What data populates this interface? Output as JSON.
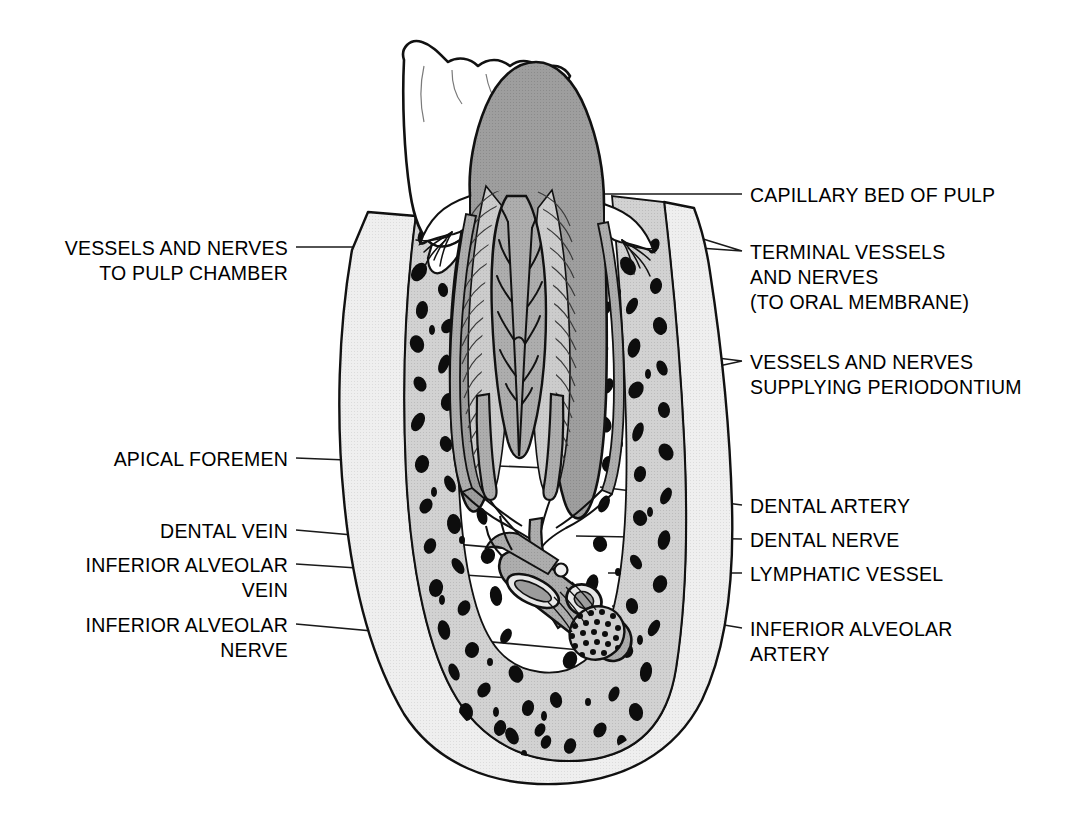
{
  "figure": {
    "background_color": "#ffffff",
    "line_color": "#000000",
    "colors": {
      "enamel": "#ffffff",
      "dentin": "#9b9b9b",
      "dentin_tubules": "#c9c9c9",
      "pulp": "#bdbdbd",
      "cortical_bone": "#ececec",
      "cancellous_bone": "#cfcfcf",
      "trabeculae": "#000000",
      "vessel_fill": "#a8a8a8",
      "gingiva": "#ffffff"
    }
  },
  "labels_left": [
    {
      "name": "vessels-and-nerves-to-pulp-chamber",
      "lines": [
        "VESSELS AND NERVES",
        "TO PULP CHAMBER"
      ],
      "text": "VESSELS AND NERVES\nTO PULP CHAMBER",
      "x": 288,
      "y": 236,
      "leader_from": [
        296,
        247
      ],
      "leader_to": [
        455,
        247
      ]
    },
    {
      "name": "apical-foramen",
      "lines": [
        "APICAL FOREMEN"
      ],
      "text": "APICAL FOREMEN",
      "x": 288,
      "y": 447,
      "leader_from": [
        296,
        458
      ],
      "leader_to": [
        548,
        468
      ]
    },
    {
      "name": "dental-vein",
      "lines": [
        "DENTAL VEIN"
      ],
      "text": "DENTAL VEIN",
      "x": 288,
      "y": 519,
      "leader_from": [
        296,
        530
      ],
      "leader_to": [
        545,
        552
      ]
    },
    {
      "name": "inferior-alveolar-vein",
      "lines": [
        "INFERIOR ALVEOLAR",
        "VEIN"
      ],
      "text": "INFERIOR ALVEOLAR\nVEIN",
      "x": 288,
      "y": 553,
      "leader_from": [
        296,
        564
      ],
      "leader_to": [
        555,
        580
      ]
    },
    {
      "name": "inferior-alveolar-nerve",
      "lines": [
        "INFERIOR ALVEOLAR",
        "NERVE"
      ],
      "text": "INFERIOR ALVEOLAR\nNERVE",
      "x": 288,
      "y": 613,
      "leader_from": [
        296,
        624
      ],
      "leader_to": [
        578,
        648
      ]
    }
  ],
  "labels_right": [
    {
      "name": "capillary-bed-of-pulp",
      "lines": [
        "CAPILLARY BED OF PULP"
      ],
      "text": "CAPILLARY BED OF PULP",
      "x": 750,
      "y": 183,
      "leader_from": [
        742,
        194
      ],
      "leader_to": [
        540,
        194
      ]
    },
    {
      "name": "terminal-vessels-and-nerves",
      "lines": [
        "TERMINAL VESSELS",
        "AND NERVES",
        "(TO ORAL MEMBRANE)"
      ],
      "text": "TERMINAL VESSELS\nAND NERVES\n(TO ORAL MEMBRANE)",
      "x": 750,
      "y": 240,
      "leader_from": [
        742,
        251
      ],
      "leader_to": [
        622,
        214
      ],
      "leader_to_2": [
        628,
        243
      ]
    },
    {
      "name": "vessels-and-nerves-supplying-periodontium",
      "lines": [
        "VESSELS AND NERVES",
        "SUPPLYING PERIODONTIUM"
      ],
      "text": "VESSELS AND NERVES\nSUPPLYING PERIODONTIUM",
      "x": 750,
      "y": 350,
      "leader_from": [
        742,
        361
      ],
      "leader_to": [
        636,
        348
      ],
      "leader_to_2": [
        640,
        383
      ]
    },
    {
      "name": "dental-artery",
      "lines": [
        "DENTAL ARTERY"
      ],
      "text": "DENTAL ARTERY",
      "x": 750,
      "y": 494,
      "leader_from": [
        742,
        505
      ],
      "leader_to": [
        600,
        487
      ]
    },
    {
      "name": "dental-nerve",
      "lines": [
        "DENTAL NERVE"
      ],
      "text": "DENTAL NERVE",
      "x": 750,
      "y": 528,
      "leader_from": [
        742,
        539
      ],
      "leader_to": [
        578,
        536
      ]
    },
    {
      "name": "lymphatic-vessel",
      "lines": [
        "LYMPHATIC VESSEL"
      ],
      "text": "LYMPHATIC VESSEL",
      "x": 750,
      "y": 562,
      "leader_from": [
        742,
        573
      ],
      "leader_to": [
        608,
        573
      ]
    },
    {
      "name": "inferior-alveolar-artery",
      "lines": [
        "INFERIOR ALVEOLAR",
        "ARTERY"
      ],
      "text": "INFERIOR ALVEOLAR\nARTERY",
      "x": 750,
      "y": 617,
      "leader_from": [
        742,
        628
      ],
      "leader_to": [
        612,
        606
      ]
    }
  ],
  "structures": [
    {
      "name": "enamel-crown",
      "label": "Enamel of adjacent tooth crown"
    },
    {
      "name": "dentin",
      "label": "Dentin"
    },
    {
      "name": "dentinal-tubules",
      "label": "Dentinal tubules"
    },
    {
      "name": "pulp-chamber",
      "label": "Pulp chamber with vessel tree"
    },
    {
      "name": "root-canal",
      "label": "Root canals"
    },
    {
      "name": "alveolar-bone",
      "label": "Alveolar bone (cancellous)"
    },
    {
      "name": "gingiva",
      "label": "Gingiva"
    },
    {
      "name": "neurovascular-bundle",
      "label": "Inferior alveolar neurovascular bundle"
    },
    {
      "name": "nerve-cut-end",
      "label": "Cut end of nerve showing fascicles"
    }
  ]
}
